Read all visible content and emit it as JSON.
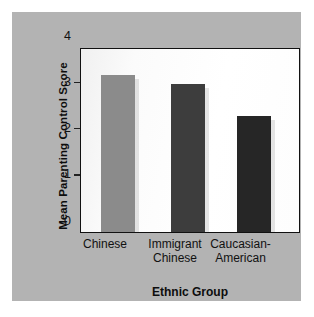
{
  "chart_data": {
    "type": "bar",
    "title": "",
    "categories": [
      "Chinese",
      "Immigrant Chinese",
      "Caucasian-American"
    ],
    "category_lines": [
      [
        "Chinese"
      ],
      [
        "Immigrant",
        "Chinese"
      ],
      [
        "Caucasian-",
        "American"
      ]
    ],
    "values": [
      3.4,
      3.2,
      2.5
    ],
    "xlabel": "Ethnic Group",
    "ylabel": "Mean Parenting Control Score",
    "ylim": [
      0,
      4
    ],
    "yticks": [
      0,
      1,
      2,
      3,
      4
    ],
    "ytick_labels": [
      "0",
      "1",
      "2",
      "3",
      "4"
    ],
    "grid": false,
    "legend": null,
    "bar_colors": [
      "#8b8b8b",
      "#3d3d3d",
      "#262626"
    ],
    "plot_background": "#ffffff",
    "panel_background": "#b3b3b3",
    "axis_color": "#111111"
  }
}
